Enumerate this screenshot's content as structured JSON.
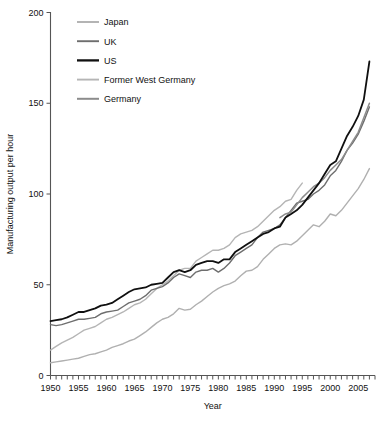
{
  "chart_data": {
    "type": "line",
    "title": "",
    "xlabel": "Year",
    "ylabel": "Manufacturing output per hour",
    "xlim": [
      1950,
      2008
    ],
    "ylim": [
      0,
      200
    ],
    "grid": false,
    "legend_position": "top-left",
    "x_ticks": [
      1950,
      1955,
      1960,
      1965,
      1970,
      1975,
      1980,
      1985,
      1990,
      1995,
      2000,
      2005
    ],
    "x_tick_labels": [
      "1950",
      "1955",
      "1960",
      "1965",
      "1970",
      "1975",
      "1980",
      "1985",
      "1990",
      "1995",
      "2000",
      "2005"
    ],
    "x_minor_tick_step": 1,
    "y_ticks": [
      0,
      50,
      100,
      150,
      200
    ],
    "y_tick_labels": [
      "0",
      "50",
      "100",
      "150",
      "200"
    ],
    "series": [
      {
        "name": "Japan",
        "color": "#b0b0b0",
        "width": 1.4,
        "x": [
          1950,
          1951,
          1952,
          1953,
          1954,
          1955,
          1956,
          1957,
          1958,
          1959,
          1960,
          1961,
          1962,
          1963,
          1964,
          1965,
          1966,
          1967,
          1968,
          1969,
          1970,
          1971,
          1972,
          1973,
          1974,
          1975,
          1976,
          1977,
          1978,
          1979,
          1980,
          1981,
          1982,
          1983,
          1984,
          1985,
          1986,
          1987,
          1988,
          1989,
          1990,
          1991,
          1992,
          1993,
          1994,
          1995,
          1996,
          1997,
          1998,
          1999,
          2000,
          2001,
          2002,
          2003,
          2004,
          2005,
          2006,
          2007
        ],
        "values": [
          7,
          7.5,
          8,
          8.5,
          9,
          9.5,
          10.5,
          11.5,
          12,
          13,
          14,
          15.5,
          16.5,
          17.5,
          19,
          20,
          22,
          24,
          26.5,
          29,
          31,
          32,
          34,
          37,
          36,
          36.5,
          39,
          41,
          43.5,
          46,
          48,
          49.5,
          50.5,
          52,
          55,
          57.5,
          58,
          60,
          64,
          67,
          70,
          72,
          72.5,
          72,
          74,
          77,
          80,
          83,
          82,
          85,
          89,
          88,
          91,
          95,
          99,
          103,
          108,
          114
        ],
        "end_value": 114
      },
      {
        "name": "UK",
        "color": "#6e6e6e",
        "width": 1.4,
        "x": [
          1950,
          1951,
          1952,
          1953,
          1954,
          1955,
          1956,
          1957,
          1958,
          1959,
          1960,
          1961,
          1962,
          1963,
          1964,
          1965,
          1966,
          1967,
          1968,
          1969,
          1970,
          1971,
          1972,
          1973,
          1974,
          1975,
          1976,
          1977,
          1978,
          1979,
          1980,
          1981,
          1982,
          1983,
          1984,
          1985,
          1986,
          1987,
          1988,
          1989,
          1990,
          1991,
          1992,
          1993,
          1994,
          1995,
          1996,
          1997,
          1998,
          1999,
          2000,
          2001,
          2002,
          2003,
          2004,
          2005,
          2006,
          2007
        ],
        "values": [
          28,
          27.5,
          28,
          29,
          30,
          31,
          31,
          31.5,
          32,
          34,
          35,
          35.5,
          36,
          38,
          40,
          41,
          42,
          44,
          47,
          48,
          49,
          51,
          54,
          56,
          55,
          54,
          57,
          58,
          58,
          59,
          57,
          59,
          62,
          66,
          68,
          70,
          72,
          76,
          79,
          80,
          81,
          83,
          87,
          91,
          95,
          96,
          97,
          100,
          102,
          105,
          110,
          113,
          118,
          124,
          128,
          133,
          140,
          148
        ],
        "end_value": 148
      },
      {
        "name": "US",
        "color": "#101010",
        "width": 1.8,
        "x": [
          1950,
          1951,
          1952,
          1953,
          1954,
          1955,
          1956,
          1957,
          1958,
          1959,
          1960,
          1961,
          1962,
          1963,
          1964,
          1965,
          1966,
          1967,
          1968,
          1969,
          1970,
          1971,
          1972,
          1973,
          1974,
          1975,
          1976,
          1977,
          1978,
          1979,
          1980,
          1981,
          1982,
          1983,
          1984,
          1985,
          1986,
          1987,
          1988,
          1989,
          1990,
          1991,
          1992,
          1993,
          1994,
          1995,
          1996,
          1997,
          1998,
          1999,
          2000,
          2001,
          2002,
          2003,
          2004,
          2005,
          2006,
          2007
        ],
        "values": [
          30,
          30.5,
          31,
          32,
          33.5,
          35,
          35,
          36,
          37,
          38.5,
          39,
          40,
          42,
          44,
          46,
          47.5,
          48,
          48.5,
          50,
          50.5,
          51,
          54,
          57,
          58,
          57,
          58,
          61,
          62,
          63,
          63,
          62,
          64,
          64,
          68,
          70,
          72,
          74,
          76,
          78,
          79,
          81,
          82,
          87,
          89,
          91,
          94,
          98,
          102,
          106,
          111,
          116,
          118,
          125,
          132,
          137,
          143,
          152,
          173
        ],
        "end_value": 173
      },
      {
        "name": "Former West Germany",
        "color": "#b5b5b5",
        "width": 1.4,
        "x": [
          1950,
          1951,
          1952,
          1953,
          1954,
          1955,
          1956,
          1957,
          1958,
          1959,
          1960,
          1961,
          1962,
          1963,
          1964,
          1965,
          1966,
          1967,
          1968,
          1969,
          1970,
          1971,
          1972,
          1973,
          1974,
          1975,
          1976,
          1977,
          1978,
          1979,
          1980,
          1981,
          1982,
          1983,
          1984,
          1985,
          1986,
          1987,
          1988,
          1989,
          1990,
          1991,
          1992,
          1993,
          1994,
          1995
        ],
        "values": [
          14,
          16,
          18,
          19.5,
          21,
          23,
          25,
          26,
          27,
          29,
          31,
          32,
          33.5,
          35,
          37,
          39,
          40,
          42,
          45,
          48,
          50,
          52,
          55,
          58,
          59,
          59,
          63,
          65,
          67,
          69,
          69,
          70,
          72,
          76,
          78,
          79,
          80,
          82,
          85,
          88,
          91,
          93,
          96,
          97,
          102,
          106
        ],
        "end_value": 106
      },
      {
        "name": "Germany",
        "color": "#8c8c8c",
        "width": 1.5,
        "x": [
          1991,
          1992,
          1993,
          1994,
          1995,
          1996,
          1997,
          1998,
          1999,
          2000,
          2001,
          2002,
          2003,
          2004,
          2005,
          2006,
          2007
        ],
        "values": [
          87,
          89,
          90,
          94,
          98,
          101,
          104,
          106,
          109,
          113,
          116,
          119,
          124,
          129,
          134,
          142,
          150
        ],
        "end_value": 150
      }
    ]
  },
  "legend": {
    "items": [
      {
        "label": "Japan"
      },
      {
        "label": "UK"
      },
      {
        "label": "US"
      },
      {
        "label": "Former West Germany"
      },
      {
        "label": "Germany"
      }
    ]
  },
  "axes": {
    "x_title": "Year",
    "y_title": "Manufacturing output per hour"
  }
}
